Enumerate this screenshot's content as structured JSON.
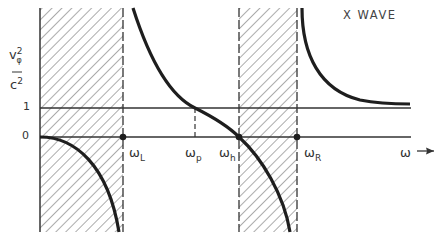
{
  "title": "X WAVE",
  "y_axis": {
    "label_num": "v",
    "label_num_sup": "2",
    "label_num_sub": "φ",
    "label_den": "c",
    "label_den_sup": "2",
    "ticks": [
      "1",
      "0"
    ]
  },
  "x_axis": {
    "label": "ω",
    "arrow": "→",
    "markers": [
      {
        "symbol": "ω",
        "sub": "L"
      },
      {
        "symbol": "ω",
        "sub": "p"
      },
      {
        "symbol": "ω",
        "sub": "h"
      },
      {
        "symbol": "ω",
        "sub": "R"
      }
    ]
  },
  "colors": {
    "curve": "#1e1e1e",
    "axis": "#333333",
    "hatch": "#555555"
  }
}
